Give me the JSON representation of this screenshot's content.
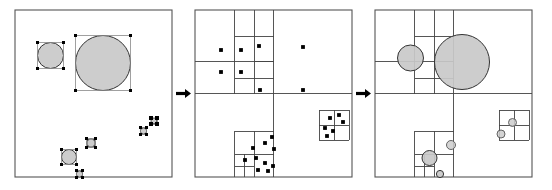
{
  "figure": {
    "width": 552,
    "height": 190,
    "background": "#ffffff",
    "panel_count": 3,
    "colors": {
      "disc_fill": "#c9c9c9",
      "disc_stroke": "#333333",
      "grid_line": "#444444",
      "frame": "#555555",
      "handle": "#000000",
      "point": "#000000",
      "arrow": "#000000"
    }
  },
  "panels": [
    {
      "id": "panel-objects",
      "name": "objects-with-bounding-boxes",
      "frame": {
        "x": 15,
        "y": 10,
        "w": 157,
        "h": 167
      },
      "discs": [
        {
          "cx": 50.5,
          "cy": 55.5,
          "r": 13.0
        },
        {
          "cx": 103.0,
          "cy": 63.0,
          "r": 27.5
        },
        {
          "cx": 69.0,
          "cy": 157.0,
          "r": 7.5
        },
        {
          "cx": 91.0,
          "cy": 143.0,
          "r": 4.2
        },
        {
          "cx": 79.5,
          "cy": 174.0,
          "r": 3.2
        },
        {
          "cx": 143.5,
          "cy": 131.0,
          "r": 3.2
        },
        {
          "cx": 154.0,
          "cy": 121.0,
          "r": 3.0
        }
      ],
      "handle_size": 3.2
    },
    {
      "id": "panel-quadtree",
      "name": "quadtree-subdivision-with-points",
      "frame": {
        "x": 195,
        "y": 10,
        "w": 157,
        "h": 167
      },
      "points": [
        {
          "x": 221,
          "y": 50
        },
        {
          "x": 241,
          "y": 50
        },
        {
          "x": 259,
          "y": 46
        },
        {
          "x": 221,
          "y": 72
        },
        {
          "x": 241,
          "y": 72
        },
        {
          "x": 260,
          "y": 90
        },
        {
          "x": 303,
          "y": 47
        },
        {
          "x": 303,
          "y": 90
        },
        {
          "x": 253,
          "y": 148
        },
        {
          "x": 265,
          "y": 143
        },
        {
          "x": 272,
          "y": 137
        },
        {
          "x": 274,
          "y": 149
        },
        {
          "x": 245,
          "y": 160
        },
        {
          "x": 256,
          "y": 158
        },
        {
          "x": 265,
          "y": 163
        },
        {
          "x": 258,
          "y": 170
        },
        {
          "x": 268,
          "y": 171
        },
        {
          "x": 273,
          "y": 166
        },
        {
          "x": 330,
          "y": 118
        },
        {
          "x": 339,
          "y": 115
        },
        {
          "x": 343,
          "y": 122
        },
        {
          "x": 325,
          "y": 128
        },
        {
          "x": 333,
          "y": 131
        },
        {
          "x": 327,
          "y": 136
        }
      ]
    },
    {
      "id": "panel-combined",
      "name": "quadtree-with-objects-overlay",
      "frame": {
        "x": 375,
        "y": 10,
        "w": 157,
        "h": 167
      },
      "discs": [
        {
          "cx": 410.5,
          "cy": 58.0,
          "r": 13.0,
          "open": false
        },
        {
          "cx": 462.0,
          "cy": 62.0,
          "r": 27.5,
          "open": false
        },
        {
          "cx": 429.5,
          "cy": 158.0,
          "r": 7.5,
          "open": false
        },
        {
          "cx": 451.0,
          "cy": 145.0,
          "r": 4.5,
          "open": true
        },
        {
          "cx": 440.0,
          "cy": 174.0,
          "r": 3.6,
          "open": false
        },
        {
          "cx": 512.5,
          "cy": 122.5,
          "r": 4.0,
          "open": true
        },
        {
          "cx": 501.0,
          "cy": 134.0,
          "r": 4.0,
          "open": true
        }
      ]
    }
  ],
  "arrows": [
    {
      "id": "arrow-1",
      "name": "arrow-panel1-to-panel2",
      "x": 176,
      "y": 93.5,
      "length": 15
    },
    {
      "id": "arrow-2",
      "name": "arrow-panel2-to-panel3",
      "x": 356,
      "y": 93.5,
      "length": 15
    }
  ],
  "grid_lines": {
    "panel_quadtree": [
      {
        "x1": 195,
        "y1": 93.5,
        "x2": 352,
        "y2": 93.5
      },
      {
        "x1": 273.5,
        "y1": 10,
        "x2": 273.5,
        "y2": 177
      },
      {
        "x1": 195,
        "y1": 61.5,
        "x2": 273.5,
        "y2": 61.5
      },
      {
        "x1": 234.5,
        "y1": 10,
        "x2": 234.5,
        "y2": 93.5
      },
      {
        "x1": 234.5,
        "y1": 36,
        "x2": 273.5,
        "y2": 36
      },
      {
        "x1": 254,
        "y1": 10,
        "x2": 254,
        "y2": 93.5
      },
      {
        "x1": 234.5,
        "y1": 78,
        "x2": 273.5,
        "y2": 78
      },
      {
        "x1": 254,
        "y1": 61.5,
        "x2": 273.5,
        "y2": 61.5
      },
      {
        "x1": 234.5,
        "y1": 131,
        "x2": 273.5,
        "y2": 131
      },
      {
        "x1": 234.5,
        "y1": 131,
        "x2": 234.5,
        "y2": 177
      },
      {
        "x1": 234.5,
        "y1": 154,
        "x2": 273.5,
        "y2": 154
      },
      {
        "x1": 254,
        "y1": 131,
        "x2": 254,
        "y2": 177
      },
      {
        "x1": 244,
        "y1": 154,
        "x2": 244,
        "y2": 177
      },
      {
        "x1": 234.5,
        "y1": 166,
        "x2": 254,
        "y2": 166
      },
      {
        "x1": 319,
        "y1": 110,
        "x2": 349,
        "y2": 110
      },
      {
        "x1": 319,
        "y1": 110,
        "x2": 319,
        "y2": 140
      },
      {
        "x1": 349,
        "y1": 110,
        "x2": 349,
        "y2": 140
      },
      {
        "x1": 319,
        "y1": 140,
        "x2": 349,
        "y2": 140
      },
      {
        "x1": 334,
        "y1": 110,
        "x2": 334,
        "y2": 140
      },
      {
        "x1": 319,
        "y1": 125,
        "x2": 349,
        "y2": 125
      }
    ],
    "panel_combined": [
      {
        "x1": 375,
        "y1": 93.5,
        "x2": 532,
        "y2": 93.5
      },
      {
        "x1": 453.5,
        "y1": 10,
        "x2": 453.5,
        "y2": 177
      },
      {
        "x1": 375,
        "y1": 61.5,
        "x2": 453.5,
        "y2": 61.5
      },
      {
        "x1": 414.5,
        "y1": 10,
        "x2": 414.5,
        "y2": 93.5
      },
      {
        "x1": 414.5,
        "y1": 36,
        "x2": 453.5,
        "y2": 36
      },
      {
        "x1": 434,
        "y1": 10,
        "x2": 434,
        "y2": 93.5
      },
      {
        "x1": 414.5,
        "y1": 78,
        "x2": 453.5,
        "y2": 78
      },
      {
        "x1": 434,
        "y1": 61.5,
        "x2": 453.5,
        "y2": 61.5
      },
      {
        "x1": 414.5,
        "y1": 131,
        "x2": 453.5,
        "y2": 131
      },
      {
        "x1": 414.5,
        "y1": 131,
        "x2": 414.5,
        "y2": 177
      },
      {
        "x1": 414.5,
        "y1": 154,
        "x2": 453.5,
        "y2": 154
      },
      {
        "x1": 434,
        "y1": 131,
        "x2": 434,
        "y2": 177
      },
      {
        "x1": 424,
        "y1": 154,
        "x2": 424,
        "y2": 177
      },
      {
        "x1": 414.5,
        "y1": 166,
        "x2": 434,
        "y2": 166
      },
      {
        "x1": 499,
        "y1": 110,
        "x2": 529,
        "y2": 110
      },
      {
        "x1": 499,
        "y1": 110,
        "x2": 499,
        "y2": 140
      },
      {
        "x1": 529,
        "y1": 110,
        "x2": 529,
        "y2": 140
      },
      {
        "x1": 499,
        "y1": 140,
        "x2": 529,
        "y2": 140
      },
      {
        "x1": 514,
        "y1": 110,
        "x2": 514,
        "y2": 140
      },
      {
        "x1": 499,
        "y1": 125,
        "x2": 529,
        "y2": 125
      }
    ]
  }
}
